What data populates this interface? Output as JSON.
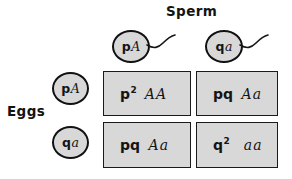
{
  "figure": {
    "type": "punnett-square"
  },
  "labels": {
    "sperm": "Sperm",
    "eggs": "Eggs"
  },
  "sperm_gametes": [
    {
      "freq": "p",
      "allele": "A"
    },
    {
      "freq": "q",
      "allele": "a"
    }
  ],
  "egg_gametes": [
    {
      "freq": "p",
      "allele": "A"
    },
    {
      "freq": "q",
      "allele": "a"
    }
  ],
  "cells": [
    {
      "id": "cell-11",
      "freq": "p",
      "exponent": "2",
      "genotype": "AA"
    },
    {
      "id": "cell-12",
      "freq": "pq",
      "exponent": "",
      "genotype": "Aa"
    },
    {
      "id": "cell-21",
      "freq": "pq",
      "exponent": "",
      "genotype": "Aa"
    },
    {
      "id": "cell-22",
      "freq": "q",
      "exponent": "2",
      "genotype": "aa"
    }
  ],
  "colors": {
    "fill": "#d8d8d8",
    "stroke": "#1a1a1a",
    "background": "#ffffff",
    "text": "#141414"
  },
  "icons": {
    "sperm_tail": "sperm-tail-icon"
  }
}
